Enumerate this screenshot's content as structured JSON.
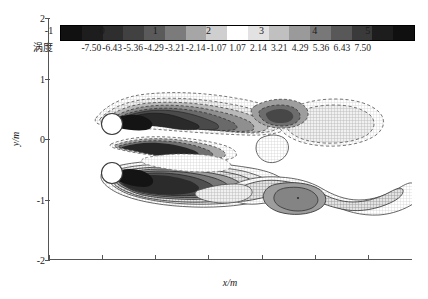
{
  "figure": {
    "colorbar": {
      "title": "涡度",
      "ticks": [
        "-7.50",
        "-6.43",
        "-5.36",
        "-4.29",
        "-3.21",
        "-2.14",
        "-1.07",
        "1.07",
        "2.14",
        "3.21",
        "4.29",
        "5.36",
        "6.43",
        "7.50"
      ],
      "colors": [
        "#111111",
        "#1d1d1d",
        "#2e2e2e",
        "#414141",
        "#5a5a5a",
        "#7b7b7b",
        "#a6a6a6",
        "#cfcfcf",
        "#ffffff",
        "#e2e2e2",
        "#c0c0c0",
        "#9a9a9a",
        "#787878",
        "#585858",
        "#3a3a3a",
        "#1d1d1d",
        "#101010"
      ],
      "vmin": -7.5,
      "vmax": 7.5
    },
    "axes": {
      "xlabel": "x/m",
      "ylabel": "y/m",
      "xticks": [
        -1,
        0,
        1,
        2,
        3,
        4,
        5
      ],
      "xticklabels": [
        "-1",
        "0",
        "1",
        "2",
        "3",
        "4",
        "5"
      ],
      "yticks": [
        2,
        1,
        0,
        -1,
        -2
      ],
      "yticklabels": [
        "2",
        "1",
        "0",
        "-1",
        "-2"
      ],
      "xlim": [
        -1.0,
        5.85
      ],
      "ylim": [
        -2.0,
        2.0
      ]
    },
    "bodies": {
      "name": "cylinder-pair",
      "shape": "circle",
      "fill": "#ffffff",
      "edge": "#333333",
      "items": [
        {
          "label": "upper-cylinder",
          "cx": 0.0,
          "cy": 0.47,
          "r": 0.26
        },
        {
          "label": "lower-cylinder",
          "cx": 0.0,
          "cy": -0.33,
          "r": 0.26
        }
      ]
    }
  },
  "chart_data": {
    "type": "heatmap",
    "title": "",
    "subtitle": "",
    "xlabel": "x/m",
    "ylabel": "y/m",
    "xlim": [
      -1.0,
      5.85
    ],
    "ylim": [
      -2.0,
      2.0
    ],
    "grid": false,
    "legend": "colorbar-above-axes",
    "colormap": "diverging-grayscale",
    "variable": "涡度",
    "levels": [
      -7.5,
      -6.43,
      -5.36,
      -4.29,
      -3.21,
      -2.14,
      -1.07,
      1.07,
      2.14,
      3.21,
      4.29,
      5.36,
      6.43,
      7.5
    ],
    "contour_style": {
      "negative": "dashed",
      "positive": "solid",
      "zero": "omitted"
    },
    "annotations": [
      "Two circular cylinders in tandem-offset arrangement near x = 0",
      "Negative (dashed) vorticity sheet shed from upper cylinder trails downstream above y = 0",
      "Positive (solid) vorticity sheet shed from lower cylinder trails downstream below y = 0",
      "Wake structures merge and roll up into discrete vortex cores near x = 3 to 5"
    ],
    "features": [
      {
        "name": "upper-shear-layer",
        "sign": "negative",
        "x_range": [
          0.1,
          2.9
        ],
        "y_range": [
          0.25,
          1.15
        ],
        "peak": -7.5
      },
      {
        "name": "lower-shear-layer",
        "sign": "positive",
        "x_range": [
          0.1,
          3.0
        ],
        "y_range": [
          -1.25,
          -0.2
        ],
        "peak": 7.5
      },
      {
        "name": "gap-jet-layer",
        "sign": "negative",
        "x_range": [
          0.2,
          2.2
        ],
        "y_range": [
          -0.15,
          0.35
        ],
        "peak": -6.4
      },
      {
        "name": "downstream-negative-blob",
        "sign": "negative",
        "x_range": [
          2.5,
          4.5
        ],
        "y_range": [
          0.2,
          1.0
        ],
        "peak": -2.1
      },
      {
        "name": "downstream-positive-vortex",
        "sign": "positive",
        "x_range": [
          2.9,
          4.4
        ],
        "y_range": [
          -0.9,
          -0.2
        ],
        "peak": 4.3
      },
      {
        "name": "tail-positive-lobe",
        "sign": "positive",
        "x_range": [
          4.4,
          5.8
        ],
        "y_range": [
          -0.8,
          0.0
        ],
        "peak": 2.1
      }
    ]
  }
}
